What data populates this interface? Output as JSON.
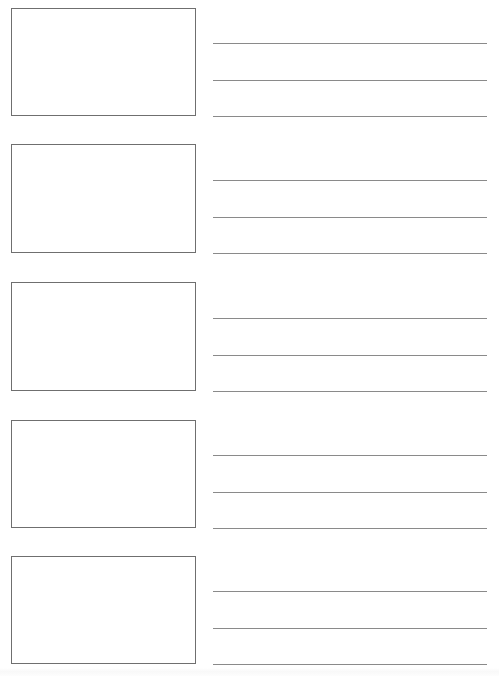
{
  "document": {
    "title": "Storyboard Worksheet",
    "kind": "blank-storyboard-template",
    "page_background": "#ffffff",
    "frame_border_color": "#6f6f6f",
    "rule_color": "#8a8a8a",
    "width": 499,
    "height": 676
  },
  "layout": {
    "frame_left": 11,
    "frame_width": 185,
    "lines_left": 213,
    "lines_width": 274,
    "rules_per_row": 3
  },
  "rows": [
    {
      "index": 1,
      "frame_label": "",
      "frame_top": 8,
      "frame_height": 108,
      "rules": [
        43,
        80,
        116
      ],
      "line_text": [
        "",
        "",
        ""
      ]
    },
    {
      "index": 2,
      "frame_label": "",
      "frame_top": 144,
      "frame_height": 109,
      "rules": [
        180,
        217,
        253
      ],
      "line_text": [
        "",
        "",
        ""
      ]
    },
    {
      "index": 3,
      "frame_label": "",
      "frame_top": 282,
      "frame_height": 109,
      "rules": [
        318,
        355,
        391
      ],
      "line_text": [
        "",
        "",
        ""
      ]
    },
    {
      "index": 4,
      "frame_label": "",
      "frame_top": 420,
      "frame_height": 108,
      "rules": [
        455,
        492,
        528
      ],
      "line_text": [
        "",
        "",
        ""
      ]
    },
    {
      "index": 5,
      "frame_label": "",
      "frame_top": 556,
      "frame_height": 108,
      "rules": [
        591,
        628,
        664
      ],
      "line_text": [
        "",
        "",
        ""
      ]
    }
  ],
  "footer": {
    "text": ""
  }
}
